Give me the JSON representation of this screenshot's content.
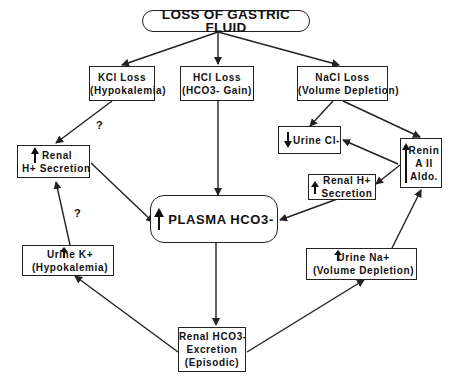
{
  "title": "LOSS OF GASTRIC FLUID",
  "nodes": {
    "kcl_loss": {
      "line1": "KCl Loss",
      "line2": "(Hypokalemia)"
    },
    "hcl_loss": {
      "line1": "HCl Loss",
      "line2": "(HCO3-   Gain)"
    },
    "nacl_loss": {
      "line1": "NaCl Loss",
      "line2": "(Volume   Depletion)"
    },
    "renal_h_left": {
      "arrow": "up",
      "line1": "Renal",
      "line2": "H+  Secretion"
    },
    "urine_cl": {
      "arrow": "down",
      "line1": "Urine   Cl-"
    },
    "renin": {
      "arrow": "up",
      "line1": "Renin",
      "line2": "A II",
      "line3": "Aldo."
    },
    "renal_h_right": {
      "arrow": "up",
      "line1": "Renal  H+",
      "line2": "Secretion"
    },
    "plasma": {
      "arrow": "up",
      "label": "PLASMA  HCO3-"
    },
    "urine_k": {
      "arrow": "up",
      "line1": "Urine   K+",
      "line2": "(Hypokalemia)"
    },
    "urine_na": {
      "arrow": "up",
      "line1": "Urine   Na+",
      "line2": "(Volume   Depletion)"
    },
    "renal_hco3": {
      "line1": "Renal  HCO3-",
      "line2": "Excretion",
      "line3": "(Episodic)"
    }
  },
  "annotations": {
    "q1": "?",
    "q2": "?"
  },
  "colors": {
    "line": "#222222",
    "background": "#ffffff"
  }
}
